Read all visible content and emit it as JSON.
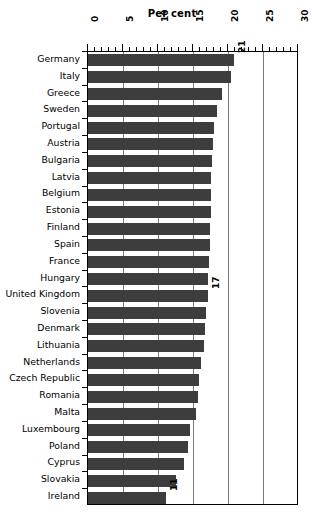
{
  "chart_data": {
    "type": "bar",
    "orientation": "horizontal",
    "title": "Per cent",
    "xlabel": "Per cent",
    "ylabel": "",
    "xlim": [
      0,
      30
    ],
    "xticks": [
      0,
      5,
      10,
      15,
      20,
      25,
      30
    ],
    "xtick_labels": [
      "0",
      "5",
      "10",
      "15",
      "20",
      "25",
      "30"
    ],
    "minor_tick_step": 1,
    "grid": "vertical-major",
    "legend": "none",
    "bar_color": "#3d3d3d",
    "categories": [
      "Germany",
      "Italy",
      "Greece",
      "Sweden",
      "Portugal",
      "Austria",
      "Bulgaria",
      "Latvia",
      "Belgium",
      "Estonia",
      "Finland",
      "Spain",
      "France",
      "Hungary",
      "United Kingdom",
      "Slovenia",
      "Denmark",
      "Lithuania",
      "Netherlands",
      "Czech Republic",
      "Romania",
      "Malta",
      "Luxembourg",
      "Poland",
      "Cyprus",
      "Slovakia",
      "Ireland"
    ],
    "values": [
      20.8,
      20.4,
      19.2,
      18.4,
      18.0,
      17.8,
      17.7,
      17.6,
      17.6,
      17.5,
      17.4,
      17.4,
      17.3,
      17.2,
      17.1,
      16.9,
      16.7,
      16.5,
      16.1,
      15.9,
      15.7,
      15.4,
      14.6,
      14.3,
      13.7,
      12.6,
      11.2
    ],
    "annotations": [
      {
        "category": "Germany",
        "label": "21"
      },
      {
        "category": "United Kingdom",
        "label": "17"
      },
      {
        "category": "Ireland",
        "label": "11"
      }
    ]
  }
}
